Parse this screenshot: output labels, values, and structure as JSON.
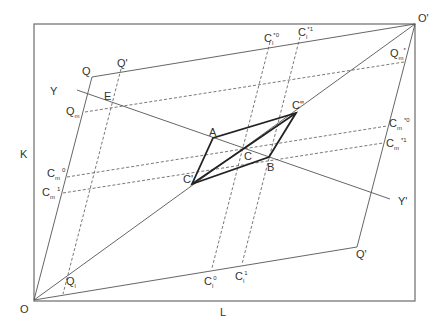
{
  "diagram": {
    "type": "edgeworth-box",
    "colors": {
      "line": "#555555",
      "frame": "#777777",
      "bold": "#222222",
      "text": "#333333",
      "background": "#ffffff"
    },
    "axes": {
      "horizontal": "L",
      "vertical": "K"
    },
    "origins": {
      "lower_left": "O",
      "upper_right": "O'"
    },
    "labels": {
      "O": "O",
      "O_prime": "O'",
      "K": "K",
      "L": "L",
      "Q": "Q",
      "Q_prime_top": "Q'",
      "Q_prime_bottom": "Q'",
      "Y": "Y",
      "Y_prime": "Y'",
      "E": "E",
      "A": "A",
      "B": "B",
      "C": "C",
      "C_prime": "C'",
      "C_double_prime": "C\"",
      "Q_m": {
        "base": "Q",
        "sub": "m"
      },
      "Q_m_star": {
        "base": "Q",
        "sub": "m",
        "sup": "*"
      },
      "Q_l": {
        "base": "Q",
        "sub": "l"
      },
      "C_m_0": {
        "base": "C",
        "sub": "m",
        "sup": "0"
      },
      "C_m_1": {
        "base": "C",
        "sub": "m",
        "sup": "1"
      },
      "C_m_star0": {
        "base": "C",
        "sub": "m",
        "sup": "*0"
      },
      "C_m_star1": {
        "base": "C",
        "sub": "m",
        "sup": "*1"
      },
      "C_l_0": {
        "base": "C",
        "sub": "l",
        "sup": "0"
      },
      "C_l_1": {
        "base": "C",
        "sub": "l",
        "sup": "1"
      },
      "C_l_star0": {
        "base": "C",
        "sub": "l",
        "sup": "*0"
      },
      "C_l_star1": {
        "base": "C",
        "sub": "l",
        "sup": "*1"
      }
    }
  }
}
